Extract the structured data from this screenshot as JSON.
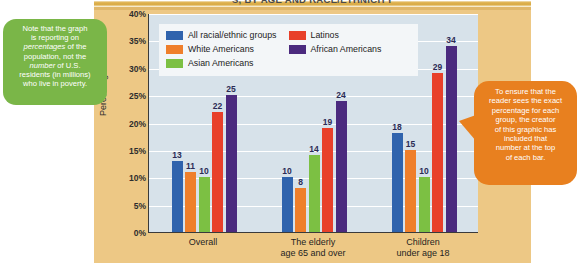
{
  "figure": {
    "title": "S, BY AGE AND RACE/ETHNICITY",
    "panel_color": "#edc885",
    "plot_background": "#d7e2ea"
  },
  "chart_data": {
    "type": "bar",
    "title": "S, BY AGE AND RACE/ETHNICITY",
    "xlabel": "",
    "ylabel": "Percentage",
    "ylim": [
      0,
      40
    ],
    "ytick_labels": [
      "0%",
      "5%",
      "10%",
      "15%",
      "20%",
      "25%",
      "30%",
      "35%",
      "40%"
    ],
    "ytick_values": [
      0,
      5,
      10,
      15,
      20,
      25,
      30,
      35,
      40
    ],
    "grid": true,
    "legend_position": "top-inside",
    "categories": [
      "Overall",
      "The elderly age 65 and over",
      "Children under age 18"
    ],
    "category_lines": [
      [
        "Overall"
      ],
      [
        "The elderly",
        "age 65 and over"
      ],
      [
        "Children",
        "under age 18"
      ]
    ],
    "series": [
      {
        "name": "All racial/ethnic groups",
        "color": "#2f63ad",
        "values": [
          13,
          10,
          18
        ]
      },
      {
        "name": "White Americans",
        "color": "#ef7f2b",
        "values": [
          11,
          8,
          15
        ]
      },
      {
        "name": "Asian Americans",
        "color": "#7cc043",
        "values": [
          10,
          14,
          10
        ]
      },
      {
        "name": "Latinos",
        "color": "#e8402a",
        "values": [
          22,
          19,
          29
        ]
      },
      {
        "name": "African Americans",
        "color": "#4b2a7e",
        "values": [
          25,
          24,
          34
        ]
      }
    ]
  },
  "annotations": {
    "green": {
      "line1": "Note that the graph",
      "line2": "is reporting on",
      "line3a": "percentages",
      "line3b": " of the",
      "line4": "population, not the",
      "line5a": "number",
      "line5b": " of U.S.",
      "line6": "residents (in millions)",
      "line7": "who live in poverty.",
      "color": "#7ab648"
    },
    "orange": {
      "line1": "To ensure that the",
      "line2": "reader sees the exact",
      "line3": "percentage for each",
      "line4": "group, the creator",
      "line5": "of this graphic has",
      "line6": "included that",
      "line7": "number at the top",
      "line8": "of each bar.",
      "color": "#e8801f"
    }
  }
}
